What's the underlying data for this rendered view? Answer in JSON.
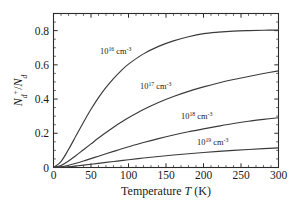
{
  "chart_data": {
    "type": "line",
    "title": "",
    "xlabel": "Temperature T (K)",
    "ylabel": "N_d^+ / N_d",
    "xlim": [
      0,
      300
    ],
    "ylim": [
      0,
      0.9
    ],
    "grid": false,
    "legend": "inline-annotations",
    "xticks": [
      0,
      50,
      100,
      150,
      200,
      250,
      300
    ],
    "xtick_labels": [
      "0",
      "50",
      "100",
      "150",
      "200",
      "250",
      "300"
    ],
    "yticks": [
      0,
      0.2,
      0.4,
      0.6,
      0.8
    ],
    "ytick_labels": [
      "0",
      "0.2",
      "0.4",
      "0.6",
      "0.8"
    ],
    "x": [
      0,
      10,
      20,
      30,
      40,
      50,
      60,
      70,
      80,
      90,
      100,
      120,
      140,
      160,
      180,
      200,
      220,
      240,
      260,
      280,
      300
    ],
    "series": [
      {
        "name": "10^16 cm^-3",
        "base": "10",
        "exponent": "16",
        "unit": "cm",
        "unit_exponent": "-3",
        "values": [
          0.0,
          0.035,
          0.105,
          0.185,
          0.265,
          0.34,
          0.408,
          0.468,
          0.52,
          0.565,
          0.604,
          0.664,
          0.708,
          0.74,
          0.764,
          0.782,
          0.791,
          0.797,
          0.8,
          0.802,
          0.803
        ]
      },
      {
        "name": "10^17 cm^-3",
        "base": "10",
        "exponent": "17",
        "unit": "cm",
        "unit_exponent": "-3",
        "values": [
          0.0,
          0.012,
          0.038,
          0.07,
          0.104,
          0.138,
          0.172,
          0.204,
          0.235,
          0.264,
          0.291,
          0.339,
          0.38,
          0.415,
          0.445,
          0.471,
          0.494,
          0.514,
          0.532,
          0.549,
          0.565
        ]
      },
      {
        "name": "10^18 cm^-3",
        "base": "10",
        "exponent": "18",
        "unit": "cm",
        "unit_exponent": "-3",
        "values": [
          0.0,
          0.004,
          0.013,
          0.025,
          0.038,
          0.052,
          0.066,
          0.08,
          0.094,
          0.108,
          0.121,
          0.146,
          0.169,
          0.19,
          0.209,
          0.226,
          0.242,
          0.257,
          0.27,
          0.281,
          0.291
        ]
      },
      {
        "name": "10^19 cm^-3",
        "base": "10",
        "exponent": "19",
        "unit": "cm",
        "unit_exponent": "-3",
        "values": [
          0.0,
          0.0013,
          0.0045,
          0.0088,
          0.0136,
          0.0188,
          0.0242,
          0.0296,
          0.035,
          0.0403,
          0.0455,
          0.0554,
          0.0645,
          0.0729,
          0.0806,
          0.0877,
          0.0941,
          0.1,
          0.1053,
          0.11,
          0.1145
        ]
      }
    ],
    "annotations": [
      {
        "text": "10^16 cm^-3",
        "x_px": 100,
        "y_px": 54
      },
      {
        "text": "10^17 cm^-3",
        "x_px": 140,
        "y_px": 89
      },
      {
        "text": "10^18 cm^-3",
        "x_px": 181,
        "y_px": 119
      },
      {
        "text": "10^19 cm^-3",
        "x_px": 197,
        "y_px": 145
      }
    ],
    "colors": {
      "curve": "#3a3a3a",
      "axis": "#2b2b2b",
      "background": "#ffffff"
    }
  }
}
